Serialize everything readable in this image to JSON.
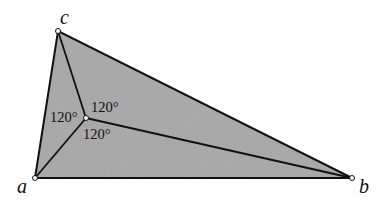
{
  "diagram": {
    "vertices": [
      {
        "name": "a",
        "x": 35,
        "y": 178,
        "label_x": 17,
        "label_y": 193
      },
      {
        "name": "b",
        "x": 352,
        "y": 178,
        "label_x": 359,
        "label_y": 193
      },
      {
        "name": "c",
        "x": 58,
        "y": 31,
        "label_x": 60,
        "label_y": 24
      }
    ],
    "interior_point": {
      "x": 86,
      "y": 118
    },
    "angles": [
      {
        "label": "120°",
        "x": 50,
        "y": 122
      },
      {
        "label": "120°",
        "x": 91,
        "y": 112
      },
      {
        "label": "120°",
        "x": 83,
        "y": 139
      }
    ],
    "colors": {
      "fill": "#9a9a9a",
      "stroke": "#111111",
      "point_fill": "#ffffff"
    }
  }
}
